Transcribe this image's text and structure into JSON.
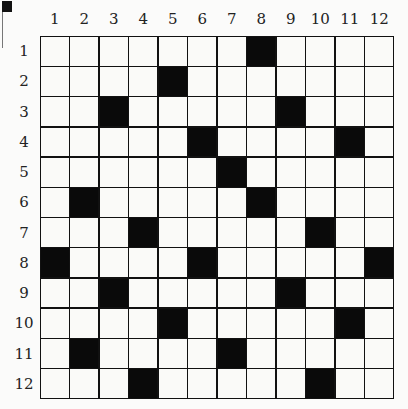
{
  "grid": {
    "rows": 12,
    "cols": 12,
    "column_labels": [
      "1",
      "2",
      "3",
      "4",
      "5",
      "6",
      "7",
      "8",
      "9",
      "10",
      "11",
      "12"
    ],
    "row_labels": [
      "1",
      "2",
      "3",
      "4",
      "5",
      "6",
      "7",
      "8",
      "9",
      "10",
      "11",
      "12"
    ],
    "black_cells": {
      "1": [
        8
      ],
      "2": [
        5
      ],
      "3": [
        3,
        9
      ],
      "4": [
        6,
        11
      ],
      "5": [
        7
      ],
      "6": [
        2,
        8
      ],
      "7": [
        4,
        10
      ],
      "8": [
        1,
        6,
        12
      ],
      "9": [
        3,
        9
      ],
      "10": [
        5,
        11
      ],
      "11": [
        2,
        7
      ],
      "12": [
        4,
        10
      ]
    },
    "colors": {
      "black": "#0a0a0a",
      "white": "#fafaf8",
      "line": "#111111"
    }
  }
}
